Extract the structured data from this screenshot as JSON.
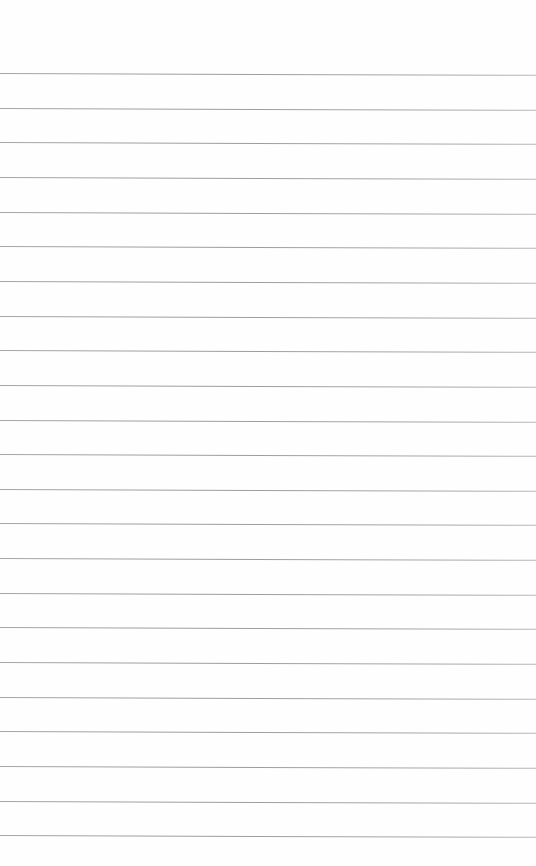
{
  "document": {
    "type": "lined-paper",
    "line_count": 23,
    "line_color": "#a0a0a0",
    "background_color": "#fefefe",
    "text_content": []
  }
}
